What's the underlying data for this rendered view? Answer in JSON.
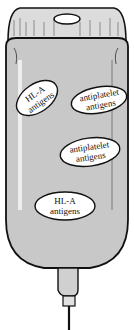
{
  "figure": {
    "colors": {
      "background": "#ffffff",
      "bag_fill": "#c8c8c8",
      "outline": "#111111",
      "ellipse_fill": "#ffffff"
    },
    "labels": [
      {
        "line1": "HL-A",
        "line2": "antigens"
      },
      {
        "line1": "antiplatelet",
        "line2": "antigens"
      },
      {
        "line1": "antiplatelet",
        "line2": "antigens"
      },
      {
        "line1": "HL-A",
        "line2": "antigens"
      }
    ]
  }
}
